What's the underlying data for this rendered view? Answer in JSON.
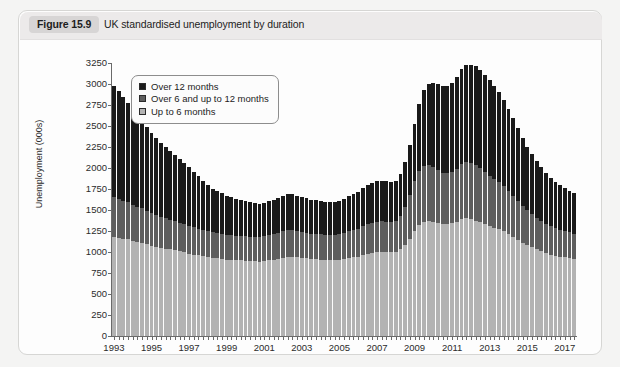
{
  "figure": {
    "label": "Figure 15.9",
    "title": "UK standardised unemployment by duration"
  },
  "chart_data": {
    "type": "bar",
    "subtype": "stacked-column",
    "title": "UK standardised unemployment by duration",
    "xlabel": "",
    "ylabel": "Unemployment (000s)",
    "ylim": [
      0,
      3250
    ],
    "ytick_step": 250,
    "yticks": [
      0,
      250,
      500,
      750,
      1000,
      1250,
      1500,
      1750,
      2000,
      2250,
      2500,
      2750,
      3000,
      3250
    ],
    "grid": false,
    "legend_position": "upper-left-inside",
    "xtick_labels": [
      "1993",
      "1995",
      "1997",
      "1999",
      "2001",
      "2003",
      "2005",
      "2007",
      "2009",
      "2011",
      "2013",
      "2015",
      "2017"
    ],
    "x_period": "quarterly",
    "x_start": "1993 Q1",
    "x_end": "2017 Q3",
    "categories": [
      "1993Q1",
      "1993Q2",
      "1993Q3",
      "1993Q4",
      "1994Q1",
      "1994Q2",
      "1994Q3",
      "1994Q4",
      "1995Q1",
      "1995Q2",
      "1995Q3",
      "1995Q4",
      "1996Q1",
      "1996Q2",
      "1996Q3",
      "1996Q4",
      "1997Q1",
      "1997Q2",
      "1997Q3",
      "1997Q4",
      "1998Q1",
      "1998Q2",
      "1998Q3",
      "1998Q4",
      "1999Q1",
      "1999Q2",
      "1999Q3",
      "1999Q4",
      "2000Q1",
      "2000Q2",
      "2000Q3",
      "2000Q4",
      "2001Q1",
      "2001Q2",
      "2001Q3",
      "2001Q4",
      "2002Q1",
      "2002Q2",
      "2002Q3",
      "2002Q4",
      "2003Q1",
      "2003Q2",
      "2003Q3",
      "2003Q4",
      "2004Q1",
      "2004Q2",
      "2004Q3",
      "2004Q4",
      "2005Q1",
      "2005Q2",
      "2005Q3",
      "2005Q4",
      "2006Q1",
      "2006Q2",
      "2006Q3",
      "2006Q4",
      "2007Q1",
      "2007Q2",
      "2007Q3",
      "2007Q4",
      "2008Q1",
      "2008Q2",
      "2008Q3",
      "2008Q4",
      "2009Q1",
      "2009Q2",
      "2009Q3",
      "2009Q4",
      "2010Q1",
      "2010Q2",
      "2010Q3",
      "2010Q4",
      "2011Q1",
      "2011Q2",
      "2011Q3",
      "2011Q4",
      "2012Q1",
      "2012Q2",
      "2012Q3",
      "2012Q4",
      "2013Q1",
      "2013Q2",
      "2013Q3",
      "2013Q4",
      "2014Q1",
      "2014Q2",
      "2014Q3",
      "2014Q4",
      "2015Q1",
      "2015Q2",
      "2015Q3",
      "2015Q4",
      "2016Q1",
      "2016Q2",
      "2016Q3",
      "2016Q4",
      "2017Q1",
      "2017Q2",
      "2017Q3"
    ],
    "series": [
      {
        "name": "Up to 6 months",
        "color": "#b3b3b3",
        "values": [
          1180,
          1170,
          1160,
          1150,
          1130,
          1120,
          1110,
          1090,
          1070,
          1060,
          1050,
          1040,
          1030,
          1020,
          1010,
          1000,
          980,
          970,
          960,
          950,
          940,
          930,
          930,
          920,
          910,
          905,
          900,
          900,
          895,
          890,
          890,
          885,
          890,
          900,
          910,
          920,
          930,
          940,
          940,
          935,
          930,
          925,
          920,
          915,
          910,
          905,
          900,
          900,
          905,
          915,
          925,
          935,
          945,
          960,
          975,
          985,
          995,
          1000,
          1000,
          995,
          1000,
          1030,
          1080,
          1160,
          1250,
          1320,
          1360,
          1370,
          1360,
          1345,
          1330,
          1330,
          1340,
          1360,
          1390,
          1400,
          1390,
          1375,
          1355,
          1330,
          1310,
          1290,
          1270,
          1245,
          1215,
          1180,
          1145,
          1110,
          1080,
          1055,
          1030,
          1010,
          990,
          970,
          955,
          945,
          935,
          925,
          915
        ]
      },
      {
        "name": "Over 6 and up to 12 months",
        "color": "#5e5e5e",
        "values": [
          470,
          460,
          450,
          440,
          430,
          420,
          410,
          400,
          390,
          380,
          370,
          360,
          350,
          345,
          340,
          335,
          330,
          325,
          320,
          315,
          310,
          305,
          300,
          300,
          295,
          295,
          290,
          290,
          290,
          290,
          290,
          290,
          295,
          300,
          305,
          310,
          315,
          320,
          320,
          315,
          310,
          305,
          300,
          300,
          300,
          300,
          300,
          300,
          305,
          310,
          320,
          325,
          335,
          345,
          355,
          360,
          365,
          365,
          360,
          360,
          370,
          400,
          450,
          520,
          590,
          640,
          670,
          670,
          650,
          630,
          615,
          610,
          615,
          630,
          655,
          670,
          665,
          655,
          640,
          620,
          600,
          580,
          560,
          540,
          515,
          490,
          465,
          440,
          415,
          395,
          375,
          360,
          345,
          335,
          325,
          320,
          315,
          310,
          305
        ]
      },
      {
        "name": "Over 12 months",
        "color": "#1a1a1a",
        "values": [
          1330,
          1290,
          1240,
          1190,
          1140,
          1090,
          1040,
          1000,
          960,
          920,
          880,
          850,
          820,
          790,
          760,
          730,
          700,
          660,
          620,
          580,
          550,
          520,
          500,
          480,
          460,
          450,
          440,
          430,
          420,
          410,
          405,
          400,
          400,
          405,
          410,
          415,
          420,
          425,
          425,
          420,
          415,
          410,
          405,
          400,
          400,
          395,
          395,
          395,
          400,
          410,
          420,
          430,
          440,
          455,
          470,
          480,
          485,
          485,
          480,
          475,
          480,
          500,
          540,
          600,
          690,
          800,
          900,
          960,
          1000,
          1020,
          1030,
          1040,
          1060,
          1090,
          1130,
          1160,
          1175,
          1180,
          1175,
          1160,
          1140,
          1110,
          1075,
          1030,
          975,
          920,
          865,
          810,
          760,
          715,
          675,
          640,
          605,
          575,
          550,
          530,
          510,
          495,
          480
        ]
      }
    ]
  },
  "legend": {
    "items": [
      {
        "label": "Over 12 months",
        "swatch": "swatch-black"
      },
      {
        "label": "Over 6 and up to 12 months",
        "swatch": "swatch-darkgray"
      },
      {
        "label": "Up to 6 months",
        "swatch": "swatch-lightgray"
      }
    ]
  }
}
